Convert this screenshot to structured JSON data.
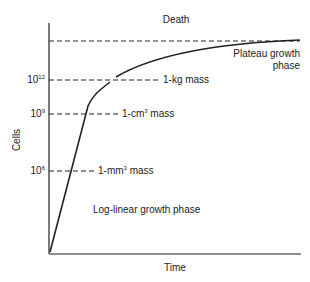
{
  "diagram": {
    "title": "",
    "x_axis_label": "Time",
    "y_axis_label": "Cells",
    "top_label": "Death",
    "phase_labels": {
      "log_linear": "Log-linear growth phase",
      "plateau_line1": "Plateau growth",
      "plateau_line2": "phase"
    },
    "levels": [
      {
        "tick_base": "10",
        "tick_exp": "12",
        "label_prefix": "1-kg mass",
        "label_exp": "",
        "label_suffix": ""
      },
      {
        "tick_base": "10",
        "tick_exp": "9",
        "label_prefix": "1-cm",
        "label_exp": "3",
        "label_suffix": " mass"
      },
      {
        "tick_base": "10",
        "tick_exp": "6",
        "label_prefix": "1-mm",
        "label_exp": "3",
        "label_suffix": " mass"
      }
    ],
    "colors": {
      "ink": "#222222",
      "background": "#ffffff"
    }
  }
}
